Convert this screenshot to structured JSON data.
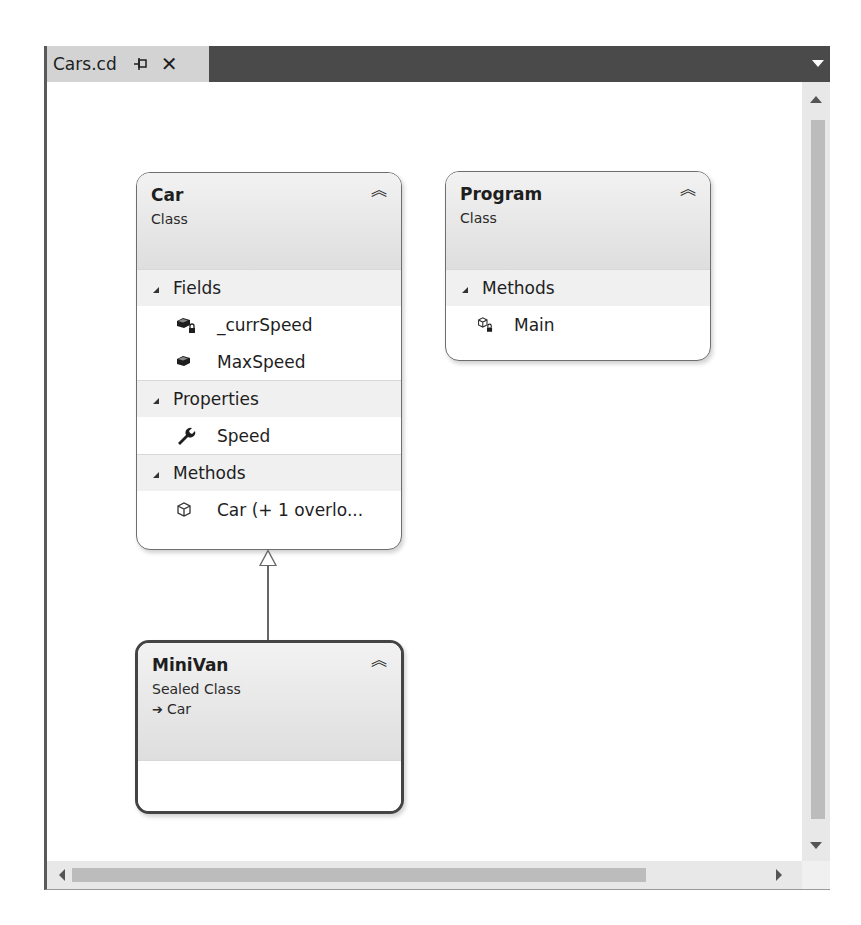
{
  "tab": {
    "title": "Cars.cd",
    "pin_icon": "pin-icon",
    "close_icon": "close-icon",
    "dropdown_icon": "chevron-down-icon"
  },
  "colors": {
    "tabbar": "#4a4a4a",
    "active_tab": "#d3d3d3",
    "shape_border": "#6e6e6e",
    "section_bg": "#f0f0f0",
    "scrollbar_thumb": "#bcbcbc"
  },
  "shapes": {
    "car": {
      "name": "Car",
      "kind": "Class",
      "collapse_icon": "double-chevron-up-icon",
      "sections": {
        "fields": {
          "label": "Fields",
          "members": [
            {
              "name": "_currSpeed",
              "icon": "private-field-icon"
            },
            {
              "name": "MaxSpeed",
              "icon": "field-icon"
            }
          ]
        },
        "properties": {
          "label": "Properties",
          "members": [
            {
              "name": "Speed",
              "icon": "property-wrench-icon"
            }
          ]
        },
        "methods": {
          "label": "Methods",
          "members": [
            {
              "name": "Car (+ 1 overlo...",
              "icon": "method-cube-icon"
            }
          ]
        }
      }
    },
    "program": {
      "name": "Program",
      "kind": "Class",
      "collapse_icon": "double-chevron-up-icon",
      "sections": {
        "methods": {
          "label": "Methods",
          "members": [
            {
              "name": "Main",
              "icon": "private-method-icon"
            }
          ]
        }
      }
    },
    "minivan": {
      "name": "MiniVan",
      "kind": "Sealed Class",
      "base": "Car",
      "collapse_icon": "double-chevron-up-icon"
    }
  },
  "relationships": [
    {
      "type": "inheritance",
      "from": "MiniVan",
      "to": "Car"
    }
  ]
}
